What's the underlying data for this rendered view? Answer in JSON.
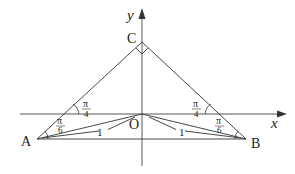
{
  "diagram": {
    "type": "geometry",
    "axes": {
      "x_label": "x",
      "y_label": "y"
    },
    "points": [
      {
        "id": "A",
        "label": "A"
      },
      {
        "id": "B",
        "label": "B"
      },
      {
        "id": "C",
        "label": "C"
      },
      {
        "id": "O",
        "label": "O"
      }
    ],
    "segments": [
      {
        "from": "A",
        "to": "C"
      },
      {
        "from": "C",
        "to": "B"
      },
      {
        "from": "A",
        "to": "B"
      },
      {
        "from": "A",
        "to": "O",
        "label": "1"
      },
      {
        "from": "O",
        "to": "B",
        "label": "1"
      }
    ],
    "angles": {
      "left_upper": {
        "num": "π",
        "den": "4"
      },
      "left_lower": {
        "num": "π",
        "den": "6"
      },
      "right_upper": {
        "num": "π",
        "den": "4"
      },
      "right_lower": {
        "num": "π",
        "den": "6"
      },
      "C_right_angle": true
    },
    "segment_labels": {
      "AO": "1",
      "OB": "1"
    },
    "colors": {
      "line": "#333333",
      "text": "#222222",
      "background": "#ffffff"
    }
  }
}
